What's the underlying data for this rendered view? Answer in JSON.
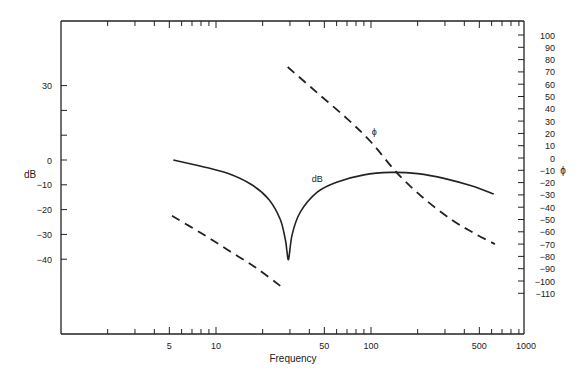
{
  "chart_data": {
    "type": "line",
    "title": "",
    "xlabel": "Frequency",
    "ylabel": "dB",
    "y2label": "ϕ",
    "xscale": "log",
    "xlim": [
      1,
      1000
    ],
    "ylim": [
      -60,
      55
    ],
    "y2lim": [
      -145,
      110
    ],
    "x_ticks": [
      5,
      10,
      50,
      100,
      500,
      1000
    ],
    "x_tick_labels": [
      "5",
      "10",
      "50",
      "100",
      "500",
      "1000"
    ],
    "y_ticks": [
      30,
      0,
      -10,
      -20,
      -30,
      -40
    ],
    "y_tick_labels": [
      "30",
      "0",
      "−10",
      "−20",
      "−30",
      "−40"
    ],
    "y_extra_ticks": [
      20,
      10
    ],
    "y2_ticks": [
      100,
      90,
      80,
      70,
      60,
      50,
      40,
      30,
      20,
      10,
      0,
      -10,
      -20,
      -30,
      -40,
      -50,
      -60,
      -70,
      -80,
      -90,
      -100,
      -110
    ],
    "y2_tick_labels": [
      "100",
      "90",
      "80",
      "70",
      "60",
      "50",
      "40",
      "30",
      "20",
      "10",
      "0",
      "−10",
      "−20",
      "−30",
      "−40",
      "−50",
      "−60",
      "−70",
      "−80",
      "−90",
      "−100",
      "−110"
    ],
    "grid": false,
    "legend": "inline labels",
    "annotations": [
      {
        "text": "dB",
        "x": 45,
        "y": -9,
        "axis": "left"
      },
      {
        "text": "ϕ",
        "x": 105,
        "y": 19,
        "axis": "right"
      }
    ],
    "series": [
      {
        "name": "dB",
        "axis": "left",
        "style": "solid",
        "x": [
          5.3,
          8,
          12,
          17,
          22,
          26,
          28,
          28.6,
          29.4,
          31,
          35,
          45,
          60,
          90,
          133,
          200,
          300,
          450,
          620
        ],
        "y": [
          0,
          -2.5,
          -5.5,
          -10,
          -16,
          -24,
          -32,
          -36,
          -40,
          -30,
          -21,
          -13,
          -9,
          -6,
          -5,
          -5.5,
          -7.5,
          -10.5,
          -13.7
        ]
      },
      {
        "name": "ϕ (low branch)",
        "axis": "right",
        "style": "dashed",
        "x": [
          5.2,
          8,
          12,
          18,
          26
        ],
        "y": [
          -47,
          -61,
          -75,
          -89,
          -104
        ]
      },
      {
        "name": "ϕ (high branch)",
        "axis": "right",
        "style": "dashed",
        "x": [
          29,
          45,
          70,
          100,
          147,
          220,
          330,
          460,
          630
        ],
        "y": [
          74,
          53,
          32,
          13,
          -12,
          -33,
          -50,
          -61,
          -70
        ]
      }
    ]
  }
}
